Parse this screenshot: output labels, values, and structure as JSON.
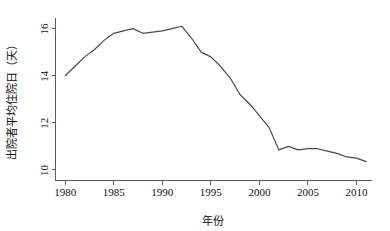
{
  "chart_data": {
    "type": "line",
    "title": "",
    "subtitle": "",
    "xlabel": "年份",
    "ylabel": "出院者平均住院日（天）",
    "xlim": [
      1979,
      2011.6
    ],
    "ylim": [
      9.55,
      16.45
    ],
    "grid": false,
    "legend": null,
    "legend_position": "none",
    "line_color": "#4a4a4a",
    "background_color": "#ffffff",
    "axis_color": "#5a5a5a",
    "x_ticks": [
      1980,
      1985,
      1990,
      1995,
      2000,
      2005,
      2010
    ],
    "x_tick_labels": [
      "1980",
      "1985",
      "1990",
      "1995",
      "2000",
      "2005",
      "2010"
    ],
    "y_ticks": [
      10,
      12,
      14,
      16
    ],
    "y_tick_labels": [
      "10",
      "12",
      "14",
      "16"
    ],
    "x": [
      1980,
      1981,
      1982,
      1983,
      1984,
      1985,
      1986,
      1987,
      1988,
      1989,
      1990,
      1991,
      1992,
      1993,
      1994,
      1995,
      1996,
      1997,
      1998,
      1999,
      2000,
      2001,
      2002,
      2003,
      2004,
      2005,
      2006,
      2007,
      2008,
      2009,
      2010,
      2011
    ],
    "series": [
      {
        "name": "出院者平均住院日",
        "values": [
          14.0,
          14.4,
          14.8,
          15.1,
          15.5,
          15.8,
          15.9,
          16.0,
          15.8,
          15.85,
          15.9,
          16.0,
          16.1,
          15.6,
          15.0,
          14.8,
          14.4,
          13.9,
          13.2,
          12.8,
          12.3,
          11.8,
          10.85,
          11.0,
          10.85,
          10.9,
          10.9,
          10.8,
          10.7,
          10.55,
          10.5,
          10.35
        ]
      }
    ]
  }
}
